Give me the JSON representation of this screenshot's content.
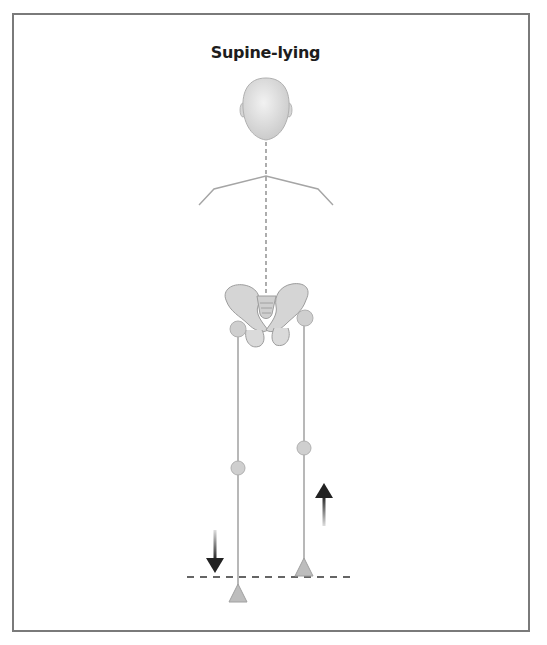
{
  "figure": {
    "title": "Supine-lying",
    "colors": {
      "frame": "#7a7a7a",
      "body_fill": "#d9d9d9",
      "body_stroke": "#a8a8a8",
      "line": "#9a9a9a",
      "arrow": "#222222",
      "dash": "#333333"
    },
    "elements": {
      "head": "head-illustration",
      "shoulders": "shoulder-line",
      "spine": "dashed-midline",
      "pelvis": "pelvis-illustration",
      "left_leg": {
        "hip": "circle",
        "knee": "circle",
        "foot": "triangle"
      },
      "right_leg": {
        "hip": "circle",
        "knee": "circle",
        "foot": "triangle"
      },
      "arrows": [
        "down-arrow (left leg)",
        "up-arrow (right leg)"
      ],
      "reference_line": "dashed-horizontal-line"
    }
  }
}
